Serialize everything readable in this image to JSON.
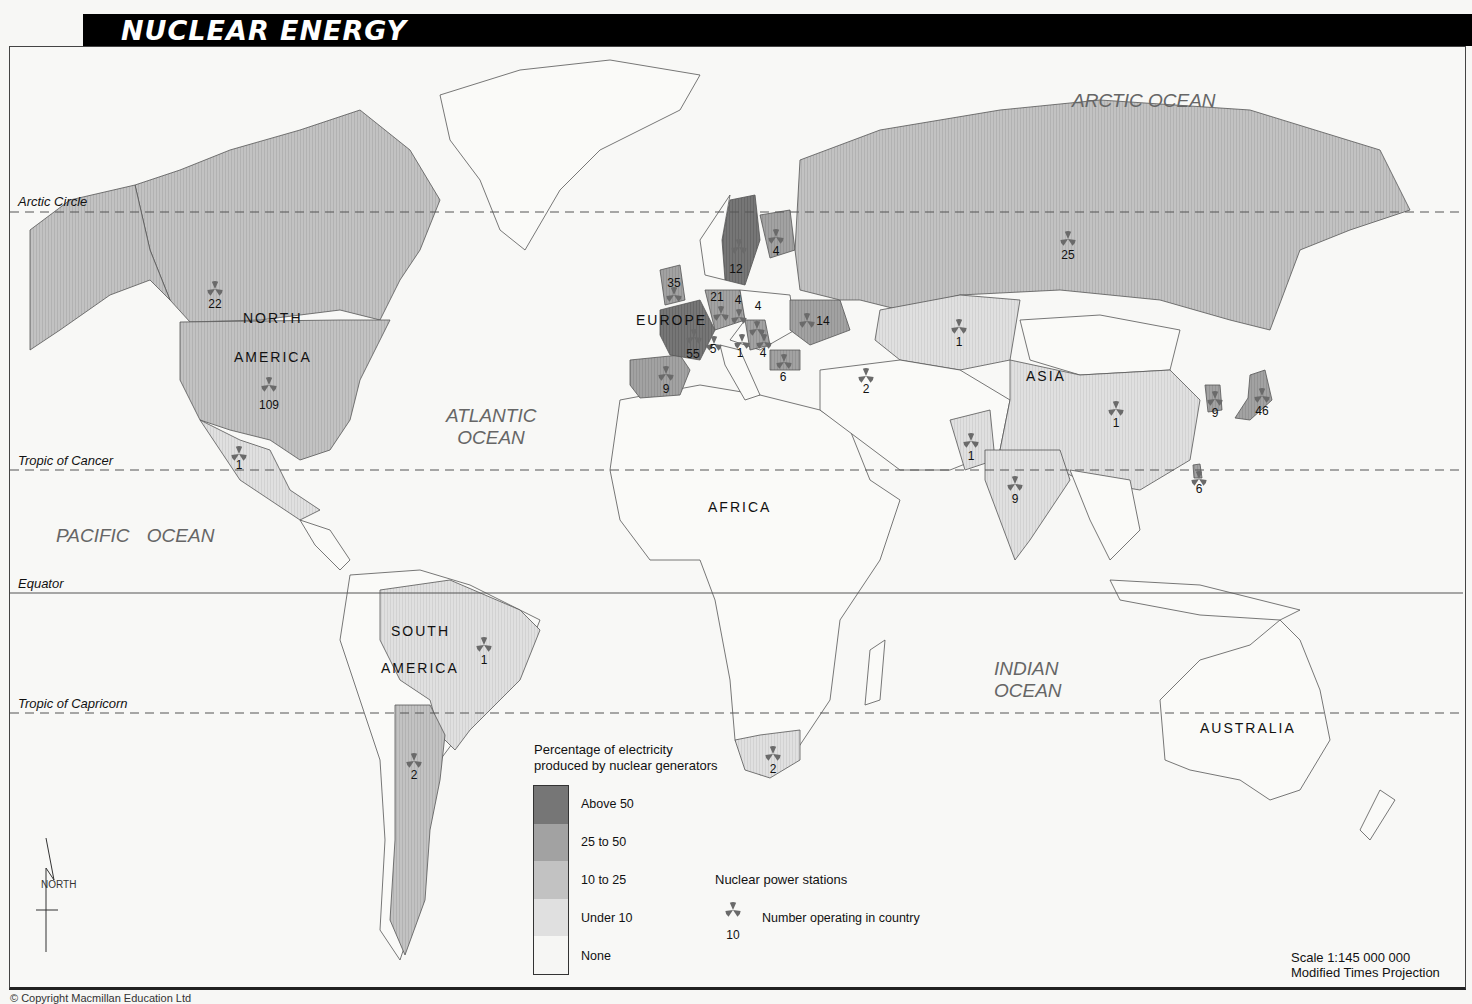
{
  "title": "NUCLEAR ENERGY",
  "oceans": [
    {
      "name": "ARCTIC OCEAN"
    },
    {
      "name": "ATLANTIC OCEAN",
      "line1": "ATLANTIC",
      "line2": "OCEAN"
    },
    {
      "name": "PACIFIC OCEAN"
    },
    {
      "name": "INDIAN OCEAN",
      "line1": "INDIAN",
      "line2": "OCEAN"
    }
  ],
  "continents": {
    "north_america": {
      "line1": "NORTH",
      "line2": "AMERICA"
    },
    "south_america": {
      "line1": "SOUTH",
      "line2": "AMERICA"
    },
    "europe": "EUROPE",
    "africa": "AFRICA",
    "asia": "ASIA",
    "australia": "AUSTRALIA"
  },
  "latitude_lines": {
    "arctic_circle": "Arctic Circle",
    "tropic_of_cancer": "Tropic of Cancer",
    "equator": "Equator",
    "tropic_of_capricorn": "Tropic of Capricorn"
  },
  "nuclear_stations": [
    {
      "country": "Canada",
      "count": "22",
      "category": "10 to 25"
    },
    {
      "country": "United States",
      "count": "109",
      "category": "10 to 25"
    },
    {
      "country": "Mexico",
      "count": "1",
      "category": "Under 10"
    },
    {
      "country": "Brazil",
      "count": "1",
      "category": "Under 10"
    },
    {
      "country": "Argentina",
      "count": "2",
      "category": "10 to 25"
    },
    {
      "country": "United Kingdom",
      "count": "35",
      "category": "25 to 50"
    },
    {
      "country": "France",
      "count": "55",
      "category": "Above 50"
    },
    {
      "country": "Spain",
      "count": "9",
      "category": "25 to 50"
    },
    {
      "country": "Sweden",
      "count": "12",
      "category": "Above 50"
    },
    {
      "country": "Finland",
      "count": "4",
      "category": "25 to 50"
    },
    {
      "country": "Germany",
      "count": "21",
      "category": "25 to 50"
    },
    {
      "country": "Czech Republic",
      "count": "4",
      "category": "25 to 50"
    },
    {
      "country": "Slovakia",
      "count": "4",
      "category": "Above 50"
    },
    {
      "country": "Switzerland",
      "count": "5",
      "category": "25 to 50"
    },
    {
      "country": "Slovenia",
      "count": "1",
      "category": "25 to 50"
    },
    {
      "country": "Hungary",
      "count": "4",
      "category": "25 to 50"
    },
    {
      "country": "Ukraine",
      "count": "14",
      "category": "25 to 50"
    },
    {
      "country": "Bulgaria",
      "count": "6",
      "category": "25 to 50"
    },
    {
      "country": "Armenia",
      "count": "2",
      "category": "25 to 50"
    },
    {
      "country": "Russia",
      "count": "25",
      "category": "10 to 25"
    },
    {
      "country": "Kazakhstan",
      "count": "1",
      "category": "Under 10"
    },
    {
      "country": "Pakistan",
      "count": "1",
      "category": "Under 10"
    },
    {
      "country": "India",
      "count": "9",
      "category": "Under 10"
    },
    {
      "country": "China",
      "count": "1",
      "category": "Under 10"
    },
    {
      "country": "South Korea",
      "count": "9",
      "category": "25 to 50"
    },
    {
      "country": "Japan",
      "count": "46",
      "category": "25 to 50"
    },
    {
      "country": "Taiwan",
      "count": "6",
      "category": "25 to 50"
    },
    {
      "country": "South Africa",
      "count": "2",
      "category": "Under 10"
    }
  ],
  "legend": {
    "title_line1": "Percentage of electricity",
    "title_line2": "produced by nuclear generators",
    "categories": [
      {
        "label": "Above 50",
        "color": "#6f6f6f"
      },
      {
        "label": "25 to 50",
        "color": "#9c9c9c"
      },
      {
        "label": "10 to 25",
        "color": "#bdbdbd"
      },
      {
        "label": "Under 10",
        "color": "#dcdcdc"
      },
      {
        "label": "None",
        "color": "#f6f6f4"
      }
    ],
    "stations_title": "Nuclear power stations",
    "stations_example_count": "10",
    "stations_desc": "Number operating in country",
    "symbol_color": "#6a6a6a"
  },
  "compass": {
    "label": "NORTH"
  },
  "scale": "Scale 1:145 000 000",
  "projection": "Modified Times Projection",
  "copyright": "© Copyright Macmillan Education Ltd"
}
